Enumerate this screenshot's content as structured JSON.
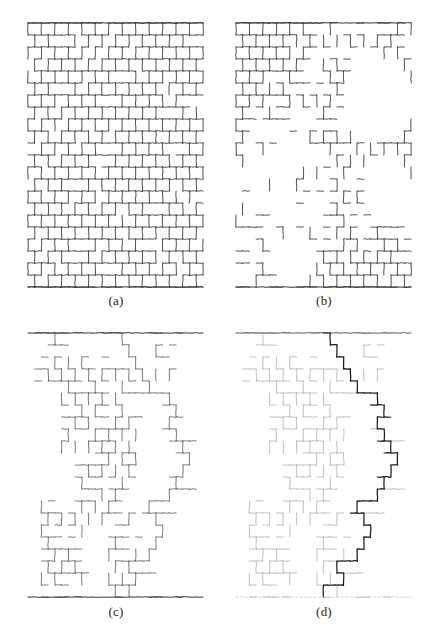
{
  "figure": {
    "type": "scientific-figure",
    "background_color": "#ffffff",
    "width": 439,
    "height": 640,
    "panel_count": 4,
    "layout": "2x2 grid"
  },
  "colors": {
    "ink_dark": "#2b2b2b",
    "ink_mid": "#555555",
    "ink_light": "#a8a8a8",
    "ink_faint": "#c8c8c8",
    "backbone": "#1a1a1a",
    "background": "#ffffff"
  },
  "panels": [
    {
      "id": "a",
      "caption": "(a)",
      "description": "dense honeycomb lattice, nearly all bonds occupied",
      "occupation": 0.92,
      "seed": 11,
      "cluster_mode": "dense",
      "top_bar": true,
      "bottom_bar": true,
      "bottom_bar_style": "solid",
      "width": 179,
      "height": 270,
      "cols": 26,
      "rows": 22
    },
    {
      "id": "b",
      "caption": "(b)",
      "description": "near-critical occupation, large voids appear",
      "occupation": 0.62,
      "seed": 27,
      "cluster_mode": "critical",
      "top_bar": true,
      "bottom_bar": true,
      "bottom_bar_style": "solid",
      "width": 179,
      "height": 270,
      "cols": 26,
      "rows": 22
    },
    {
      "id": "c",
      "caption": "(c)",
      "description": "isolated spanning cluster connecting top and bottom bars",
      "occupation": 0.18,
      "seed": 5,
      "cluster_mode": "spanning",
      "top_bar": true,
      "bottom_bar": true,
      "bottom_bar_style": "solid",
      "width": 179,
      "height": 270,
      "cols": 26,
      "rows": 22
    },
    {
      "id": "d",
      "caption": "(d)",
      "description": "same spanning cluster with conducting backbone darkened and dangling ends in light grey",
      "occupation": 0.18,
      "seed": 5,
      "cluster_mode": "backbone",
      "top_bar": true,
      "bottom_bar": true,
      "bottom_bar_style": "dashed-faint",
      "width": 179,
      "height": 270,
      "cols": 26,
      "rows": 22
    }
  ],
  "chart_data": {
    "type": "diagram",
    "title": "",
    "series": [
      {
        "name": "(a)",
        "occupation_probability": 0.92,
        "label": "dense"
      },
      {
        "name": "(b)",
        "occupation_probability": 0.62,
        "label": "critical"
      },
      {
        "name": "(c)",
        "occupation_probability": 0.18,
        "label": "spanning cluster"
      },
      {
        "name": "(d)",
        "occupation_probability": 0.18,
        "label": "backbone"
      }
    ]
  }
}
